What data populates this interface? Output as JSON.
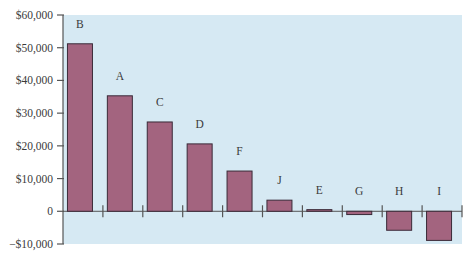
{
  "chart_data": {
    "type": "bar",
    "title": "",
    "xlabel": "",
    "ylabel": "",
    "categories": [
      "B",
      "A",
      "C",
      "D",
      "F",
      "J",
      "E",
      "G",
      "H",
      "I"
    ],
    "values": [
      51200,
      35300,
      27300,
      20600,
      12300,
      3400,
      500,
      -1000,
      -5800,
      -8900
    ],
    "ylim": [
      -10000,
      60000
    ],
    "yticks": [
      60000,
      50000,
      40000,
      30000,
      20000,
      10000,
      0,
      -10000
    ],
    "ytick_labels": [
      "$60,000",
      "$50,000",
      "$40,000",
      "$30,000",
      "$20,000",
      "$10,000",
      "0",
      "−$10,000"
    ],
    "grid": false,
    "legend": null,
    "colors": {
      "plot_background": "#d6e9f3",
      "bar_fill": "#a3647f",
      "bar_stroke": "#3a2a38",
      "axis": "#555555"
    }
  }
}
